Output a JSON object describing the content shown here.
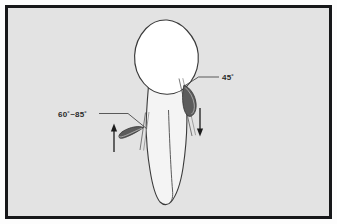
{
  "figure": {
    "name": "tooth-root-instrumentation-angles-diagram",
    "type": "technical-illustration",
    "frame": {
      "border_color": "#17181a",
      "border_width_px": 3,
      "background_color": "#e3e3e3",
      "outer_margin_color": "#fdfdfd"
    },
    "colors": {
      "outline": "#3a3a3a",
      "crown_fill": "#ffffff",
      "root_fill": "#f4f4f4",
      "blade_fill": "#5c5c5c",
      "blade_fill_light": "#8d8d8d",
      "leader_line": "#4a4a4a",
      "arrow": "#1c1c1c",
      "text": "#2a2a2a"
    }
  },
  "annotations": [
    {
      "id": "angle-left",
      "label": "60˚~85˚",
      "value_range": [
        60,
        85
      ],
      "unit": "degrees",
      "position": "left",
      "leader_target": "left-blade-instrument",
      "x": 58,
      "y": 116
    },
    {
      "id": "angle-right",
      "label": "45˚",
      "value_range": [
        45,
        45
      ],
      "unit": "degrees",
      "position": "right",
      "leader_target": "right-blade-instrument",
      "x": 222,
      "y": 80
    }
  ],
  "arrows": [
    {
      "id": "arrow-left-up",
      "direction": "up",
      "x": 114,
      "y_from": 152,
      "y_to": 126
    },
    {
      "id": "arrow-right-down",
      "direction": "down",
      "x": 200,
      "y_from": 108,
      "y_to": 134
    }
  ],
  "parts": [
    {
      "id": "tooth-crown",
      "label": "crown"
    },
    {
      "id": "tooth-root",
      "label": "root"
    },
    {
      "id": "root-canal-line",
      "label": "root canal outline"
    },
    {
      "id": "left-blade-instrument",
      "label": "left curette blade"
    },
    {
      "id": "right-blade-instrument",
      "label": "right curette blade"
    },
    {
      "id": "left-shank",
      "label": "left instrument shank"
    },
    {
      "id": "right-shank",
      "label": "right instrument shank"
    }
  ]
}
